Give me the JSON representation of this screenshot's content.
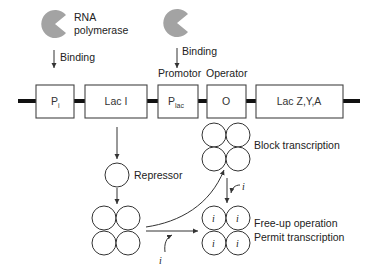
{
  "diagram": {
    "colors": {
      "polymerase": "#a3a3a3",
      "dna": "#111111",
      "stroke": "#333333"
    },
    "polymerase_1": {
      "label_line1": "RNA",
      "label_line2": "polymerase",
      "action": "Binding"
    },
    "polymerase_2": {
      "action": "Binding"
    },
    "region_labels": {
      "promotor": "Promotor",
      "operator": "Operator"
    },
    "genes": [
      {
        "id": "pi",
        "label": "P",
        "sub": "i"
      },
      {
        "id": "laci",
        "label": "Lac I",
        "sub": ""
      },
      {
        "id": "plac",
        "label": "P",
        "sub": "lac"
      },
      {
        "id": "operator",
        "label": "O",
        "sub": ""
      },
      {
        "id": "laczya",
        "label": "Lac Z,Y,A",
        "sub": ""
      }
    ],
    "repressor": {
      "label": "Repressor"
    },
    "states": {
      "block": "Block transcription",
      "free_line1": "Free-up operation",
      "free_line2": "Permit transcription"
    },
    "inducer": {
      "symbol": "i"
    }
  }
}
